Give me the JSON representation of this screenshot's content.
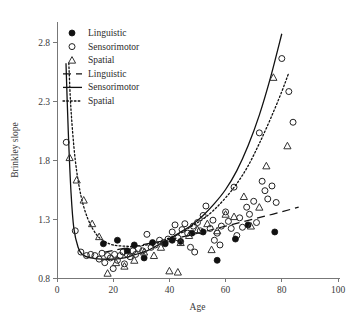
{
  "chart_data": {
    "type": "scatter",
    "title": "",
    "xlabel": "Age",
    "ylabel": "Brinkley slope",
    "xlim": [
      0,
      100
    ],
    "ylim": [
      0.8,
      2.9
    ],
    "xticks": [
      0,
      20,
      40,
      60,
      80,
      100
    ],
    "yticks": [
      0.8,
      1.3,
      1.8,
      2.3,
      2.8
    ],
    "xtick_labels": [
      "0",
      "20",
      "40",
      "60",
      "80",
      "100"
    ],
    "ytick_labels": [
      "0.8",
      "1.3",
      "1.8",
      "2.3",
      "2.8"
    ],
    "grid": false,
    "legend_position": "top-left",
    "legend": [
      {
        "label": "Linguistic",
        "marker": "filled-circle",
        "kind": "marker"
      },
      {
        "label": "Sensorimotor",
        "marker": "open-circle",
        "kind": "marker"
      },
      {
        "label": "Spatial",
        "marker": "open-triangle",
        "kind": "marker"
      },
      {
        "label": "Linguistic",
        "marker": "dashed-line",
        "kind": "line"
      },
      {
        "label": "Sensorimotor",
        "marker": "solid-line",
        "kind": "line"
      },
      {
        "label": "Spatial",
        "marker": "dotted-line",
        "kind": "line"
      }
    ],
    "series": [
      {
        "name": "Sensorimotor",
        "marker": "open-circle",
        "points": [
          [
            3.3,
            1.95
          ],
          [
            6.5,
            1.2
          ],
          [
            8.5,
            1.02
          ],
          [
            10.5,
            0.99
          ],
          [
            12.0,
            1.0
          ],
          [
            13.5,
            0.99
          ],
          [
            15.0,
            0.96
          ],
          [
            16.0,
            1.01
          ],
          [
            17.0,
            0.93
          ],
          [
            18.0,
            0.99
          ],
          [
            19.0,
            0.97
          ],
          [
            20.0,
            0.88
          ],
          [
            20.5,
            1.0
          ],
          [
            21.5,
            0.95
          ],
          [
            22.5,
            0.99
          ],
          [
            23.5,
            1.02
          ],
          [
            24.0,
            0.92
          ],
          [
            25.0,
            1.0
          ],
          [
            26.0,
            0.98
          ],
          [
            27.0,
            1.03
          ],
          [
            28.0,
            1.0
          ],
          [
            29.0,
            1.05
          ],
          [
            30.5,
            1.03
          ],
          [
            32.0,
            1.17
          ],
          [
            33.5,
            1.06
          ],
          [
            35.0,
            1.08
          ],
          [
            36.5,
            1.12
          ],
          [
            38.0,
            1.1
          ],
          [
            39.5,
            1.13
          ],
          [
            41.0,
            1.19
          ],
          [
            42.0,
            1.25
          ],
          [
            43.0,
            1.14
          ],
          [
            44.5,
            1.21
          ],
          [
            45.5,
            1.26
          ],
          [
            46.5,
            1.18
          ],
          [
            47.5,
            1.06
          ],
          [
            48.5,
            1.24
          ],
          [
            50.0,
            1.27
          ],
          [
            51.0,
            1.2
          ],
          [
            52.0,
            1.33
          ],
          [
            53.0,
            1.41
          ],
          [
            54.5,
            1.22
          ],
          [
            55.5,
            1.29
          ],
          [
            57.0,
            1.18
          ],
          [
            58.5,
            1.24
          ],
          [
            60.0,
            1.36
          ],
          [
            61.0,
            1.28
          ],
          [
            62.0,
            1.22
          ],
          [
            63.0,
            1.57
          ],
          [
            64.0,
            1.16
          ],
          [
            65.0,
            1.31
          ],
          [
            66.0,
            1.23
          ],
          [
            67.5,
            1.4
          ],
          [
            68.5,
            1.34
          ],
          [
            70.0,
            1.45
          ],
          [
            71.0,
            1.27
          ],
          [
            72.0,
            2.03
          ],
          [
            73.0,
            1.62
          ],
          [
            74.0,
            1.54
          ],
          [
            75.0,
            1.47
          ],
          [
            76.5,
            1.58
          ],
          [
            78.0,
            1.44
          ],
          [
            80.0,
            2.66
          ],
          [
            82.5,
            2.38
          ],
          [
            84.0,
            2.12
          ],
          [
            58.0,
            1.08
          ],
          [
            56.0,
            1.12
          ],
          [
            49.0,
            1.02
          ]
        ]
      },
      {
        "name": "Linguistic",
        "marker": "filled-circle",
        "points": [
          [
            21.5,
            1.12
          ],
          [
            25.0,
            1.03
          ],
          [
            27.5,
            1.08
          ],
          [
            31.0,
            0.97
          ],
          [
            34.0,
            1.1
          ],
          [
            38.5,
            1.09
          ],
          [
            41.0,
            1.12
          ],
          [
            44.0,
            1.11
          ],
          [
            48.0,
            1.18
          ],
          [
            52.0,
            1.19
          ],
          [
            57.0,
            0.95
          ],
          [
            63.5,
            1.13
          ],
          [
            68.0,
            1.25
          ],
          [
            77.5,
            1.19
          ],
          [
            16.5,
            1.09
          ]
        ]
      },
      {
        "name": "Spatial",
        "marker": "open-triangle",
        "points": [
          [
            4.5,
            1.82
          ],
          [
            7.0,
            1.63
          ],
          [
            9.5,
            1.46
          ],
          [
            12.5,
            1.26
          ],
          [
            15.0,
            1.15
          ],
          [
            18.0,
            0.84
          ],
          [
            21.0,
            0.93
          ],
          [
            24.0,
            0.9
          ],
          [
            27.5,
            0.95
          ],
          [
            31.0,
            1.02
          ],
          [
            34.5,
            0.99
          ],
          [
            37.0,
            1.06
          ],
          [
            40.0,
            0.86
          ],
          [
            44.0,
            1.1
          ],
          [
            47.0,
            1.16
          ],
          [
            50.0,
            1.21
          ],
          [
            53.5,
            1.26
          ],
          [
            57.0,
            1.2
          ],
          [
            60.0,
            1.34
          ],
          [
            63.0,
            1.32
          ],
          [
            66.5,
            1.49
          ],
          [
            69.0,
            1.24
          ],
          [
            72.0,
            1.4
          ],
          [
            74.5,
            1.75
          ],
          [
            77.0,
            2.5
          ],
          [
            82.0,
            1.92
          ],
          [
            55.0,
            1.04
          ],
          [
            43.0,
            0.85
          ]
        ]
      }
    ],
    "fit_lines": [
      {
        "name": "Sensorimotor",
        "style": "solid",
        "points": [
          [
            3.2,
            2.62
          ],
          [
            4.0,
            2.05
          ],
          [
            5.0,
            1.52
          ],
          [
            6.0,
            1.22
          ],
          [
            7.5,
            1.06
          ],
          [
            9.0,
            1.0
          ],
          [
            12.0,
            0.97
          ],
          [
            16.0,
            0.96
          ],
          [
            20.0,
            0.96
          ],
          [
            24.0,
            0.97
          ],
          [
            28.0,
            1.0
          ],
          [
            32.0,
            1.03
          ],
          [
            36.0,
            1.08
          ],
          [
            40.0,
            1.13
          ],
          [
            44.0,
            1.19
          ],
          [
            48.0,
            1.25
          ],
          [
            52.0,
            1.33
          ],
          [
            56.0,
            1.43
          ],
          [
            60.0,
            1.55
          ],
          [
            64.0,
            1.71
          ],
          [
            68.0,
            1.92
          ],
          [
            72.0,
            2.18
          ],
          [
            76.0,
            2.5
          ],
          [
            80.0,
            2.87
          ]
        ]
      },
      {
        "name": "Spatial",
        "style": "dotted",
        "points": [
          [
            4.2,
            2.62
          ],
          [
            5.0,
            2.22
          ],
          [
            6.5,
            1.8
          ],
          [
            8.5,
            1.5
          ],
          [
            11.0,
            1.3
          ],
          [
            14.0,
            1.17
          ],
          [
            17.0,
            1.11
          ],
          [
            20.0,
            1.08
          ],
          [
            24.0,
            1.07
          ],
          [
            28.0,
            1.07
          ],
          [
            32.0,
            1.08
          ],
          [
            36.0,
            1.1
          ],
          [
            40.0,
            1.14
          ],
          [
            44.0,
            1.18
          ],
          [
            48.0,
            1.24
          ],
          [
            52.0,
            1.3
          ],
          [
            56.0,
            1.38
          ],
          [
            60.0,
            1.48
          ],
          [
            64.0,
            1.6
          ],
          [
            68.0,
            1.75
          ],
          [
            72.0,
            1.94
          ],
          [
            76.0,
            2.15
          ],
          [
            80.0,
            2.38
          ],
          [
            82.5,
            2.54
          ]
        ]
      },
      {
        "name": "Linguistic",
        "style": "dashed",
        "points": [
          [
            17.0,
            1.02
          ],
          [
            30.0,
            1.08
          ],
          [
            45.0,
            1.15
          ],
          [
            60.0,
            1.24
          ],
          [
            75.0,
            1.33
          ],
          [
            86.0,
            1.4
          ]
        ]
      }
    ]
  },
  "legend_text": {
    "linguistic": "Linguistic",
    "sensorimotor": "Sensorimotor",
    "spatial": "Spatial"
  },
  "colors": {
    "axis": "#777777",
    "text": "#3a3a3a",
    "marker": "#222222",
    "curve": "#111111"
  }
}
